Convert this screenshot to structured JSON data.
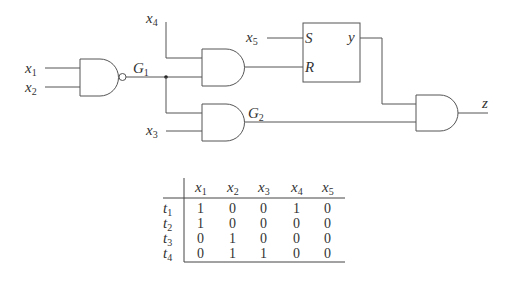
{
  "diagram": {
    "inputs": {
      "x1": {
        "var": "x",
        "sub": "1"
      },
      "x2": {
        "var": "x",
        "sub": "2"
      },
      "x3": {
        "var": "x",
        "sub": "3"
      },
      "x4": {
        "var": "x",
        "sub": "4"
      },
      "x5": {
        "var": "x",
        "sub": "5"
      }
    },
    "gates": {
      "g1": {
        "var": "G",
        "sub": "1",
        "type": "NAND"
      },
      "g_top": {
        "type": "AND"
      },
      "g2": {
        "var": "G",
        "sub": "2",
        "type": "AND"
      },
      "g_out": {
        "type": "AND"
      }
    },
    "flipflop": {
      "type": "SR",
      "s_label": "S",
      "r_label": "R",
      "q_label": "y"
    },
    "output": {
      "label": "z"
    }
  },
  "table": {
    "headers": [
      {
        "var": "x",
        "sub": "1"
      },
      {
        "var": "x",
        "sub": "2"
      },
      {
        "var": "x",
        "sub": "3"
      },
      {
        "var": "x",
        "sub": "4"
      },
      {
        "var": "x",
        "sub": "5"
      }
    ],
    "rows": [
      {
        "label": {
          "var": "t",
          "sub": "1"
        },
        "values": [
          "1",
          "0",
          "0",
          "1",
          "0"
        ]
      },
      {
        "label": {
          "var": "t",
          "sub": "2"
        },
        "values": [
          "1",
          "0",
          "0",
          "0",
          "0"
        ]
      },
      {
        "label": {
          "var": "t",
          "sub": "3"
        },
        "values": [
          "0",
          "1",
          "0",
          "0",
          "0"
        ]
      },
      {
        "label": {
          "var": "t",
          "sub": "4"
        },
        "values": [
          "0",
          "1",
          "1",
          "0",
          "0"
        ]
      }
    ]
  }
}
